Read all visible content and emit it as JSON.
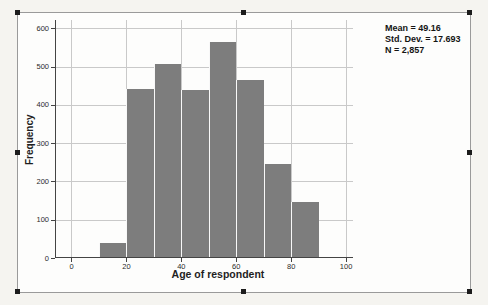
{
  "window": {
    "background_color": "#f5f4f0"
  },
  "chart_frame": {
    "border_color": "#9a9a9a",
    "background_color": "#fdfdfc",
    "selection_handle_color": "#1c1c1c",
    "selected": true
  },
  "chart_data": {
    "type": "bar",
    "chart_kind": "histogram",
    "title": "",
    "xlabel": "Age of respondent",
    "ylabel": "Frequency",
    "bin_start": 10,
    "bin_width": 10,
    "categories": [
      "10-20",
      "20-30",
      "30-40",
      "40-50",
      "50-60",
      "60-70",
      "70-80",
      "80-90"
    ],
    "values": [
      40,
      441,
      508,
      440,
      565,
      466,
      246,
      146
    ],
    "x_ticks": [
      0,
      20,
      40,
      60,
      80,
      100
    ],
    "y_ticks": [
      0,
      100,
      200,
      300,
      400,
      500,
      600
    ],
    "xlim": [
      -6,
      102.5
    ],
    "ylim": [
      0,
      622
    ],
    "grid": true,
    "legend": "none",
    "bar_color": "#7d7d7d",
    "grid_color": "#c9c9c9",
    "axis_color": "#444444",
    "annotations": [
      "Mean = 49.16",
      "Std. Dev. = 17.693",
      "N = 2,857"
    ],
    "stats": {
      "mean": 49.16,
      "std_dev": 17.693,
      "n": "2,857"
    }
  }
}
